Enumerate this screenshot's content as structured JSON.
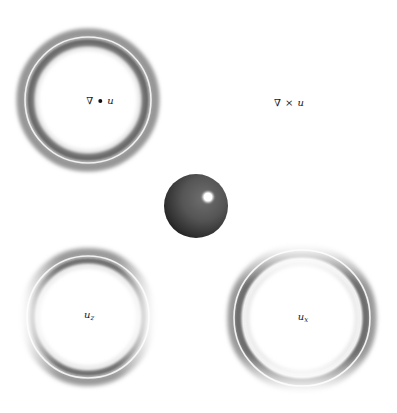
{
  "figure": {
    "background": "#ffffff",
    "panels": [
      {
        "id": "divergence",
        "position": "top-left",
        "label": {
          "nabla": "∇",
          "operator": "•",
          "variable": "u"
        },
        "ring": {
          "cx": 88,
          "cy": 100,
          "r": 61,
          "fade": "none"
        }
      },
      {
        "id": "curl",
        "position": "top-right",
        "label": {
          "nabla": "∇",
          "operator": "×",
          "variable": "u"
        },
        "ring": null
      },
      {
        "id": "uz",
        "position": "bottom-left",
        "label": {
          "variable": "u",
          "subscript": "z"
        },
        "ring": {
          "cx": 88,
          "cy": 317,
          "r": 61,
          "fade": "left-right"
        }
      },
      {
        "id": "ux",
        "position": "bottom-right",
        "label": {
          "variable": "u",
          "subscript": "x"
        },
        "ring": {
          "cx": 302,
          "cy": 318,
          "r": 66,
          "fade": "top-bottom"
        }
      }
    ],
    "sphere": {
      "cx": 196,
      "cy": 206,
      "r": 32,
      "highlight": {
        "cx": 208,
        "cy": 197,
        "r": 5
      },
      "color": "#4a4a4a"
    }
  }
}
